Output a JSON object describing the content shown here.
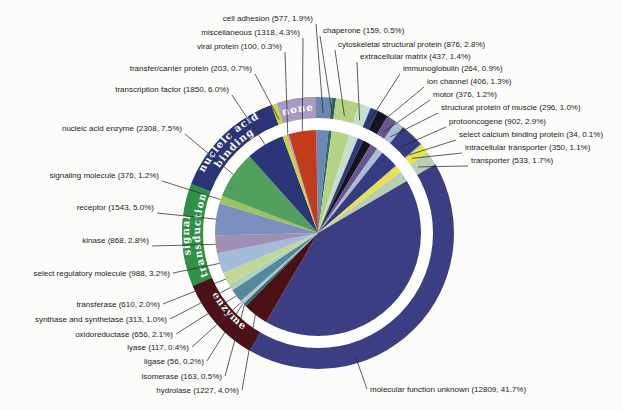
{
  "figure": {
    "kind": "printed-figure",
    "background": "#fcfcfa"
  },
  "chart_data": {
    "type": "pie",
    "label_format": "{name} ({count}, {pct}%)",
    "slices": [
      {
        "id": "cell_adhesion",
        "name": "cell adhesion",
        "count": 577,
        "pct": "1.9",
        "color": "#6d87b6",
        "group": null
      },
      {
        "id": "chaperone",
        "name": "chaperone",
        "count": 159,
        "pct": "0.5",
        "color": "#2a6861",
        "group": null
      },
      {
        "id": "cytoskeletal_structural_protein",
        "name": "cytoskeletal structural protein",
        "count": 876,
        "pct": "2.8",
        "color": "#b3d283",
        "group": null
      },
      {
        "id": "extracellular_matrix",
        "name": "extracellular matrix",
        "count": 437,
        "pct": "1.4",
        "color": "#c8dfc9",
        "group": null
      },
      {
        "id": "immunoglobulin",
        "name": "immunoglobulin",
        "count": 264,
        "pct": "0.9",
        "color": "#2e3a7b",
        "group": null
      },
      {
        "id": "ion_channel",
        "name": "ion channel",
        "count": 406,
        "pct": "1.3",
        "color": "#14141e",
        "group": null
      },
      {
        "id": "motor",
        "name": "motor",
        "count": 376,
        "pct": "1.2",
        "color": "#6a568e",
        "group": null
      },
      {
        "id": "structural_protein_of_muscle",
        "name": "structural protein of muscle",
        "count": 296,
        "pct": "1.0",
        "color": "#abbdd4",
        "group": null
      },
      {
        "id": "protooncogene",
        "name": "protooncogene",
        "count": 902,
        "pct": "2.9",
        "color": "#353c80",
        "group": null
      },
      {
        "id": "select_calcium_binding_protein",
        "name": "select calcium binding protein",
        "count": 34,
        "pct": "0.1",
        "color": "#7a9ec0",
        "group": null
      },
      {
        "id": "intracellular_transporter",
        "name": "intracellular transporter",
        "count": 350,
        "pct": "1.1",
        "color": "#e8e446",
        "group": null
      },
      {
        "id": "transporter",
        "name": "transporter",
        "count": 533,
        "pct": "1.7",
        "color": "#b9cfb4",
        "group": null
      },
      {
        "id": "molecular_function_unknown",
        "name": "molecular function unknown",
        "count": 12809,
        "pct": "41.7",
        "color": "#3b3e82",
        "group": null
      },
      {
        "id": "hydrolase",
        "name": "hydrolase",
        "count": 1227,
        "pct": "4.0",
        "color": "#4a1016",
        "group": "enzyme"
      },
      {
        "id": "isomerase",
        "name": "isomerase",
        "count": 163,
        "pct": "0.5",
        "color": "#2a6e74",
        "group": "enzyme"
      },
      {
        "id": "ligase",
        "name": "ligase",
        "count": 56,
        "pct": "0.2",
        "color": "#9db8c2",
        "group": "enzyme"
      },
      {
        "id": "lyase",
        "name": "lyase",
        "count": 117,
        "pct": "0.4",
        "color": "#afc6d0",
        "group": "enzyme"
      },
      {
        "id": "oxidoreductase",
        "name": "oxidoreductase",
        "count": 656,
        "pct": "2.1",
        "color": "#54889c",
        "group": "enzyme"
      },
      {
        "id": "synthase_and_synthetase",
        "name": "synthase and synthetase",
        "count": 313,
        "pct": "1.0",
        "color": "#aed0bc",
        "group": "enzyme"
      },
      {
        "id": "transferase",
        "name": "transferase",
        "count": 610,
        "pct": "2.0",
        "color": "#c3d795",
        "group": "enzyme"
      },
      {
        "id": "select_regulatory_molecule",
        "name": "select regulatory molecule",
        "count": 988,
        "pct": "3.2",
        "color": "#a3bcd8",
        "group": "signal_transduction"
      },
      {
        "id": "kinase",
        "name": "kinase",
        "count": 868,
        "pct": "2.8",
        "color": "#a08fb5",
        "group": "signal_transduction"
      },
      {
        "id": "receptor",
        "name": "receptor",
        "count": 1543,
        "pct": "5.0",
        "color": "#7b90be",
        "group": "signal_transduction"
      },
      {
        "id": "signaling_molecule",
        "name": "signaling molecule",
        "count": 376,
        "pct": "1.2",
        "color": "#9ec25e",
        "group": "signal_transduction"
      },
      {
        "id": "nucleic_acid_enzyme",
        "name": "nucleic acid enzyme",
        "count": 2308,
        "pct": "7.5",
        "color": "#51a05e",
        "group": "nucleic_acid_binding"
      },
      {
        "id": "transcription_factor",
        "name": "transcription factor",
        "count": 1850,
        "pct": "6.0",
        "color": "#2c3577",
        "group": "nucleic_acid_binding"
      },
      {
        "id": "transfer_carrier_protein",
        "name": "transfer/carrier protein",
        "count": 203,
        "pct": "0.7",
        "color": "#cfd23e",
        "group": null
      },
      {
        "id": "viral_protein",
        "name": "viral protein",
        "count": 100,
        "pct": "0.3",
        "color": "#a89dc6",
        "group": "none"
      },
      {
        "id": "miscellaneous",
        "name": "miscellaneous",
        "count": 1318,
        "pct": "4.3",
        "color": "#c03c1d",
        "group": "none"
      }
    ],
    "ring_groups": [
      {
        "id": "nucleic_acid_binding",
        "label": "nucleic acid binding",
        "label_lines": [
          "nucleic acid",
          "binding"
        ],
        "color": "#2b3478",
        "text_color": "#ffffff"
      },
      {
        "id": "none",
        "label": "none",
        "label_lines": [
          "none"
        ],
        "color": "#a79cc4",
        "text_color": "#ffffff"
      },
      {
        "id": "signal_transduction",
        "label": "signal transduction",
        "label_lines": [
          "signal",
          "transduction"
        ],
        "color": "#2e9147",
        "text_color": "#ffffff"
      },
      {
        "id": "enzyme",
        "label": "enzyme",
        "label_lines": [
          "enzyme"
        ],
        "color": "#4d1016",
        "text_color": "#ffffff"
      }
    ]
  }
}
